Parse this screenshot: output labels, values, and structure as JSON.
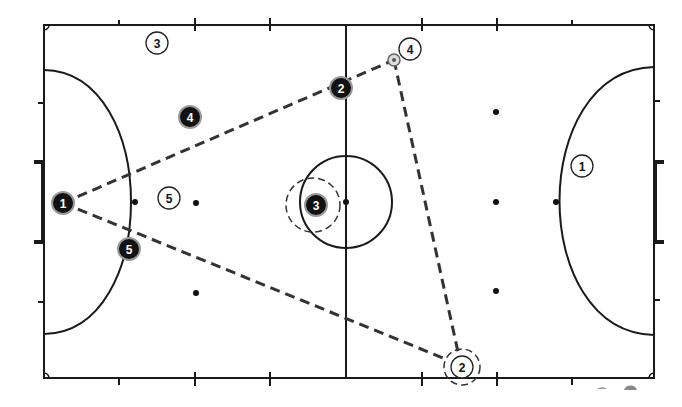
{
  "diagram": {
    "type": "futsal-court-tactics",
    "colors": {
      "line": "#1a1a1a",
      "pass": "#333333",
      "dark_player_fill": "#111111",
      "light_player_fill": "#ffffff"
    },
    "team_dark": [
      {
        "id": "1",
        "label": "1",
        "x": 63,
        "y": 203
      },
      {
        "id": "2",
        "label": "2",
        "x": 341,
        "y": 88
      },
      {
        "id": "3",
        "label": "3",
        "x": 316,
        "y": 205
      },
      {
        "id": "4",
        "label": "4",
        "x": 190,
        "y": 117
      },
      {
        "id": "5",
        "label": "5",
        "x": 129,
        "y": 249
      }
    ],
    "team_light": [
      {
        "id": "1",
        "label": "1",
        "x": 582,
        "y": 166
      },
      {
        "id": "2",
        "label": "2",
        "x": 462,
        "y": 367
      },
      {
        "id": "3",
        "label": "3",
        "x": 157,
        "y": 43
      },
      {
        "id": "4",
        "label": "4",
        "x": 410,
        "y": 49
      },
      {
        "id": "5",
        "label": "5",
        "x": 169,
        "y": 198
      }
    ],
    "ball": {
      "x": 394,
      "y": 60
    },
    "pressure_rings": [
      {
        "name": "ring-dark-3",
        "x": 313,
        "y": 205,
        "r": 27
      },
      {
        "name": "ring-light-2",
        "x": 462,
        "y": 367,
        "r": 18
      }
    ],
    "passes": [
      {
        "from": "dark-1",
        "to": "dark-2",
        "x1": 63,
        "y1": 203,
        "x2": 394,
        "y2": 60
      },
      {
        "from": "ball",
        "to": "light-2",
        "x1": 394,
        "y1": 60,
        "x2": 458,
        "y2": 352
      },
      {
        "from": "dark-1",
        "to": "light-2",
        "x1": 63,
        "y1": 203,
        "x2": 448,
        "y2": 360
      }
    ]
  }
}
